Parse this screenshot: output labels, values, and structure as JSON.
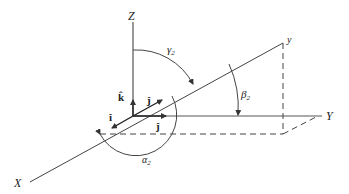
{
  "diagram": {
    "type": "direction-angles-3d",
    "axes": {
      "x_label": "X",
      "y_label": "Y",
      "z_label": "Z"
    },
    "vector_label": "y",
    "unit_vectors": {
      "i_hat": "î",
      "j_hat_on_vector": "ĵ",
      "j_hat_on_axis": "ĵ",
      "k_hat": "k̂"
    },
    "angles": {
      "alpha": "α",
      "alpha_sub": "2",
      "beta": "β",
      "beta_sub": "2",
      "gamma": "γ",
      "gamma_sub": "2"
    },
    "colors": {
      "line": "#333333",
      "background": "#ffffff"
    }
  }
}
